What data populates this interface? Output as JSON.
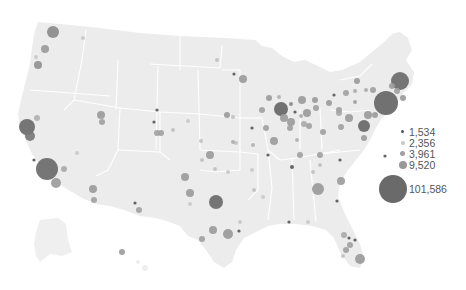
{
  "map": {
    "type": "proportional-symbol",
    "region": "United States",
    "land_color": "#ececec",
    "border_color": "#ffffff",
    "bubbles": [
      {
        "x": 53,
        "y": 32,
        "r": 6,
        "color": "#8a8a8a"
      },
      {
        "x": 83,
        "y": 38,
        "r": 2,
        "color": "#c8c8c8"
      },
      {
        "x": 45,
        "y": 49,
        "r": 4,
        "color": "#9a9a9a"
      },
      {
        "x": 36,
        "y": 57,
        "r": 2,
        "color": "#c8c8c8"
      },
      {
        "x": 38,
        "y": 65,
        "r": 4,
        "color": "#909090"
      },
      {
        "x": 101,
        "y": 115,
        "r": 4,
        "color": "#9a9a9a"
      },
      {
        "x": 102,
        "y": 122,
        "r": 3,
        "color": "#a0a0a0"
      },
      {
        "x": 37,
        "y": 118,
        "r": 3,
        "color": "#b0b0b0"
      },
      {
        "x": 27,
        "y": 127,
        "r": 8,
        "color": "#6a6a6a"
      },
      {
        "x": 30,
        "y": 136,
        "r": 5,
        "color": "#777"
      },
      {
        "x": 34,
        "y": 160,
        "r": 1.6,
        "color": "#555"
      },
      {
        "x": 47,
        "y": 169,
        "r": 11,
        "color": "#6a6a6a"
      },
      {
        "x": 64,
        "y": 169,
        "r": 3,
        "color": "#a8a8a8"
      },
      {
        "x": 56,
        "y": 183,
        "r": 5,
        "color": "#9a9a9a"
      },
      {
        "x": 77,
        "y": 153,
        "r": 2,
        "color": "#c8c8c8"
      },
      {
        "x": 93,
        "y": 189,
        "r": 4,
        "color": "#9a9a9a"
      },
      {
        "x": 94,
        "y": 200,
        "r": 3,
        "color": "#a0a0a0"
      },
      {
        "x": 135,
        "y": 203,
        "r": 1.6,
        "color": "#555"
      },
      {
        "x": 139,
        "y": 210,
        "r": 3,
        "color": "#a0a0a0"
      },
      {
        "x": 122,
        "y": 252,
        "r": 3,
        "color": "#9a9a9a"
      },
      {
        "x": 154,
        "y": 122,
        "r": 1.6,
        "color": "#555"
      },
      {
        "x": 157,
        "y": 133,
        "r": 3,
        "color": "#a0a0a0"
      },
      {
        "x": 217,
        "y": 60,
        "r": 2,
        "color": "#c0c0c0"
      },
      {
        "x": 234,
        "y": 74,
        "r": 1.6,
        "color": "#555"
      },
      {
        "x": 243,
        "y": 79,
        "r": 4,
        "color": "#9a9a9a"
      },
      {
        "x": 269,
        "y": 98,
        "r": 3,
        "color": "#9a9a9a"
      },
      {
        "x": 279,
        "y": 97,
        "r": 2,
        "color": "#b0b0b0"
      },
      {
        "x": 281,
        "y": 109,
        "r": 7,
        "color": "#666"
      },
      {
        "x": 291,
        "y": 104,
        "r": 2,
        "color": "#888"
      },
      {
        "x": 295,
        "y": 112,
        "r": 1.6,
        "color": "#555"
      },
      {
        "x": 302,
        "y": 100,
        "r": 4,
        "color": "#9a9a9a"
      },
      {
        "x": 315,
        "y": 100,
        "r": 3,
        "color": "#9a9a9a"
      },
      {
        "x": 316,
        "y": 108,
        "r": 3,
        "color": "#a0a0a0"
      },
      {
        "x": 329,
        "y": 103,
        "r": 3,
        "color": "#9a9a9a"
      },
      {
        "x": 339,
        "y": 113,
        "r": 3,
        "color": "#a8a8a8"
      },
      {
        "x": 355,
        "y": 102,
        "r": 2,
        "color": "#a0a0a0"
      },
      {
        "x": 284,
        "y": 118,
        "r": 4,
        "color": "#9a9a9a"
      },
      {
        "x": 291,
        "y": 122,
        "r": 4,
        "color": "#9a9a9a"
      },
      {
        "x": 290,
        "y": 128,
        "r": 3,
        "color": "#a0a0a0"
      },
      {
        "x": 262,
        "y": 110,
        "r": 3,
        "color": "#a0a0a0"
      },
      {
        "x": 274,
        "y": 141,
        "r": 4,
        "color": "#9a9a9a"
      },
      {
        "x": 300,
        "y": 155,
        "r": 3,
        "color": "#a0a0a0"
      },
      {
        "x": 236,
        "y": 143,
        "r": 2,
        "color": "#c0c0c0"
      },
      {
        "x": 253,
        "y": 145,
        "r": 2,
        "color": "#b0b0b0"
      },
      {
        "x": 268,
        "y": 155,
        "r": 1.6,
        "color": "#555"
      },
      {
        "x": 292,
        "y": 167,
        "r": 2,
        "color": "#555"
      },
      {
        "x": 252,
        "y": 170,
        "r": 2,
        "color": "#c8c8c8"
      },
      {
        "x": 210,
        "y": 155,
        "r": 4,
        "color": "#9a9a9a"
      },
      {
        "x": 215,
        "y": 169,
        "r": 2,
        "color": "#c0c0c0"
      },
      {
        "x": 228,
        "y": 172,
        "r": 2,
        "color": "#c8c8c8"
      },
      {
        "x": 185,
        "y": 177,
        "r": 4,
        "color": "#9a9a9a"
      },
      {
        "x": 190,
        "y": 193,
        "r": 4,
        "color": "#9a9a9a"
      },
      {
        "x": 202,
        "y": 160,
        "r": 2,
        "color": "#c0c0c0"
      },
      {
        "x": 190,
        "y": 204,
        "r": 2,
        "color": "#c8c8c8"
      },
      {
        "x": 216,
        "y": 202,
        "r": 7,
        "color": "#6a6a6a"
      },
      {
        "x": 213,
        "y": 230,
        "r": 4,
        "color": "#9a9a9a"
      },
      {
        "x": 202,
        "y": 239,
        "r": 3,
        "color": "#a0a0a0"
      },
      {
        "x": 228,
        "y": 234,
        "r": 5,
        "color": "#999"
      },
      {
        "x": 239,
        "y": 231,
        "r": 1.6,
        "color": "#555"
      },
      {
        "x": 240,
        "y": 222,
        "r": 2,
        "color": "#c8c8c8"
      },
      {
        "x": 188,
        "y": 121,
        "r": 2,
        "color": "#c8c8c8"
      },
      {
        "x": 157,
        "y": 110,
        "r": 1.6,
        "color": "#555"
      },
      {
        "x": 161,
        "y": 133,
        "r": 3,
        "color": "#a0a0a0"
      },
      {
        "x": 173,
        "y": 130,
        "r": 2,
        "color": "#c0c0c0"
      },
      {
        "x": 201,
        "y": 141,
        "r": 2,
        "color": "#c0c0c0"
      },
      {
        "x": 227,
        "y": 115,
        "r": 3,
        "color": "#9a9a9a"
      },
      {
        "x": 233,
        "y": 142,
        "r": 2,
        "color": "#aaa"
      },
      {
        "x": 266,
        "y": 128,
        "r": 3,
        "color": "#a0a0a0"
      },
      {
        "x": 252,
        "y": 128,
        "r": 1.6,
        "color": "#555"
      },
      {
        "x": 233,
        "y": 117,
        "r": 2,
        "color": "#c0c0c0"
      },
      {
        "x": 307,
        "y": 113,
        "r": 4,
        "color": "#9a9a9a"
      },
      {
        "x": 309,
        "y": 126,
        "r": 3,
        "color": "#a0a0a0"
      },
      {
        "x": 301,
        "y": 116,
        "r": 2,
        "color": "#aaa"
      },
      {
        "x": 304,
        "y": 124,
        "r": 3,
        "color": "#aaa"
      },
      {
        "x": 323,
        "y": 132,
        "r": 3,
        "color": "#a0a0a0"
      },
      {
        "x": 339,
        "y": 110,
        "r": 3,
        "color": "#a0a0a0"
      },
      {
        "x": 349,
        "y": 118,
        "r": 4,
        "color": "#9a9a9a"
      },
      {
        "x": 341,
        "y": 127,
        "r": 3,
        "color": "#a0a0a0"
      },
      {
        "x": 364,
        "y": 126,
        "r": 6,
        "color": "#666"
      },
      {
        "x": 368,
        "y": 115,
        "r": 4,
        "color": "#9a9a9a"
      },
      {
        "x": 346,
        "y": 93,
        "r": 3,
        "color": "#a0a0a0"
      },
      {
        "x": 355,
        "y": 91,
        "r": 2,
        "color": "#aaa"
      },
      {
        "x": 334,
        "y": 95,
        "r": 1.6,
        "color": "#555"
      },
      {
        "x": 357,
        "y": 81,
        "r": 3,
        "color": "#9a9a9a"
      },
      {
        "x": 366,
        "y": 90,
        "r": 2,
        "color": "#aaa"
      },
      {
        "x": 373,
        "y": 90,
        "r": 3,
        "color": "#a0a0a0"
      },
      {
        "x": 386,
        "y": 103,
        "r": 12,
        "color": "#666"
      },
      {
        "x": 375,
        "y": 115,
        "r": 3,
        "color": "#9a9a9a"
      },
      {
        "x": 400,
        "y": 81,
        "r": 9,
        "color": "#6a6a6a"
      },
      {
        "x": 392,
        "y": 86,
        "r": 3,
        "color": "#9a9a9a"
      },
      {
        "x": 397,
        "y": 91,
        "r": 3,
        "color": "#a0a0a0"
      },
      {
        "x": 403,
        "y": 98,
        "r": 3,
        "color": "#9a9a9a"
      },
      {
        "x": 364,
        "y": 138,
        "r": 3,
        "color": "#9a9a9a"
      },
      {
        "x": 385,
        "y": 156,
        "r": 1.6,
        "color": "#555"
      },
      {
        "x": 341,
        "y": 181,
        "r": 4,
        "color": "#9a9a9a"
      },
      {
        "x": 318,
        "y": 189,
        "r": 6,
        "color": "#999"
      },
      {
        "x": 320,
        "y": 165,
        "r": 2,
        "color": "#c0c0c0"
      },
      {
        "x": 337,
        "y": 201,
        "r": 1.6,
        "color": "#555"
      },
      {
        "x": 344,
        "y": 235,
        "r": 3,
        "color": "#aaa"
      },
      {
        "x": 349,
        "y": 238,
        "r": 1.6,
        "color": "#555"
      },
      {
        "x": 350,
        "y": 245,
        "r": 3,
        "color": "#a0a0a0"
      },
      {
        "x": 355,
        "y": 240,
        "r": 1.6,
        "color": "#555"
      },
      {
        "x": 346,
        "y": 250,
        "r": 3,
        "color": "#a0a0a0"
      },
      {
        "x": 360,
        "y": 259,
        "r": 5,
        "color": "#999"
      },
      {
        "x": 289,
        "y": 222,
        "r": 1.6,
        "color": "#555"
      },
      {
        "x": 308,
        "y": 222,
        "r": 2,
        "color": "#c8c8c8"
      },
      {
        "x": 343,
        "y": 256,
        "r": 2,
        "color": "#c0c0c0"
      },
      {
        "x": 320,
        "y": 155,
        "r": 3,
        "color": "#a0a0a0"
      },
      {
        "x": 340,
        "y": 160,
        "r": 1.6,
        "color": "#555"
      },
      {
        "x": 254,
        "y": 190,
        "r": 2,
        "color": "#c0c0c0"
      },
      {
        "x": 263,
        "y": 197,
        "r": 2,
        "color": "#c8c8c8"
      },
      {
        "x": 297,
        "y": 140,
        "r": 2,
        "color": "#b0b0b0"
      },
      {
        "x": 313,
        "y": 172,
        "r": 2,
        "color": "#c0c0c0"
      }
    ]
  },
  "legend": {
    "items": [
      {
        "label": "1,534",
        "r": 1.5,
        "color": "#555555"
      },
      {
        "label": "2,356",
        "r": 2,
        "color": "#c8c8c8"
      },
      {
        "label": "3,961",
        "r": 2.5,
        "color": "#a0a0a0"
      },
      {
        "label": "9,520",
        "r": 4,
        "color": "#999999"
      },
      {
        "label": "101,586",
        "r": 14,
        "color": "#6a6a6a"
      }
    ]
  }
}
